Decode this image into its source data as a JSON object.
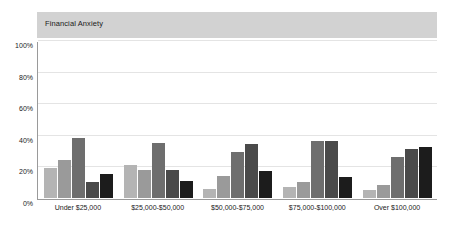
{
  "chart_data": {
    "type": "bar",
    "title": "Financial Anxiety",
    "xlabel": "",
    "ylabel": "",
    "ylim": [
      0,
      100
    ],
    "yticks": [
      0,
      20,
      40,
      60,
      80,
      100
    ],
    "ytick_labels": [
      "0%",
      "20%",
      "40%",
      "60%",
      "80%",
      "100%"
    ],
    "grid": true,
    "legend": "none",
    "value_unit": "%",
    "categories": [
      "Under $25,000",
      "$25,000-$50,000",
      "$50,000-$75,000",
      "$75,000-$100,000",
      "Over $100,000"
    ],
    "series": [
      {
        "name": "Series 1",
        "color": "#b4b4b4",
        "values": [
          19,
          21,
          6,
          7,
          5
        ]
      },
      {
        "name": "Series 2",
        "color": "#9a9a9a",
        "values": [
          24,
          18,
          14,
          10,
          8
        ]
      },
      {
        "name": "Series 3",
        "color": "#6e6e6e",
        "values": [
          38,
          35,
          29,
          36,
          26
        ]
      },
      {
        "name": "Series 4",
        "color": "#4a4a4a",
        "values": [
          10,
          18,
          34,
          36,
          31
        ]
      },
      {
        "name": "Series 5",
        "color": "#1c1c1c",
        "values": [
          15,
          11,
          17,
          13,
          32
        ]
      }
    ]
  },
  "style": {
    "header_band_color": "#d2d2d2",
    "gridline_color": "#e4e4e4",
    "axis_color": "#9a9a9a",
    "background": "#ffffff",
    "text_color": "#1a1a1a"
  }
}
